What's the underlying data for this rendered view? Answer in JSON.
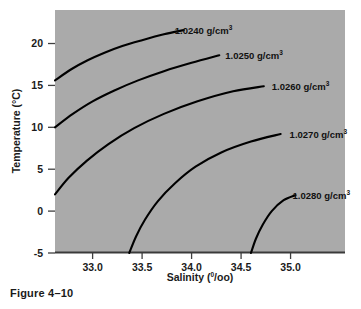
{
  "caption": "Figure 4–10",
  "colors": {
    "plot_background": "#aaaaaa",
    "page_background": "#ffffff",
    "contour_line": "#000000",
    "axis": "#3a3a3a",
    "text": "#1a1a1a"
  },
  "chart_data": {
    "type": "line",
    "title": "",
    "subtitle": "",
    "xlabel_text": "Salinity (",
    "xlabel_sup": "0",
    "xlabel_tail": "/oo)",
    "xlabel_full": "Salinity (0/oo)",
    "ylabel": "Temperature (°C)",
    "xlim": [
      32.62,
      35.55
    ],
    "ylim": [
      -5,
      24
    ],
    "xticks": [
      33.0,
      33.5,
      34.0,
      34.5,
      35.0
    ],
    "xtick_labels": [
      "33.0",
      "33.5",
      "34.0",
      "34.5",
      "35.0"
    ],
    "yticks": [
      20,
      15,
      10,
      5,
      0,
      -5
    ],
    "ytick_labels": [
      "20",
      "15",
      "10",
      "5",
      "0",
      "-5"
    ],
    "grid": false,
    "legend": "none",
    "annotation_note": "Each curve is an isopycnal (constant seawater density) labeled in g/cm3",
    "series": [
      {
        "name": "1.0240 g/cm3",
        "label_value": "1.0240",
        "label_unit": "g/cm",
        "label_sup": "3",
        "label_x": 33.79,
        "label_y": 21.6,
        "points": [
          [
            32.62,
            15.6
          ],
          [
            32.78,
            16.9
          ],
          [
            32.95,
            18.0
          ],
          [
            33.12,
            18.9
          ],
          [
            33.3,
            19.7
          ],
          [
            33.5,
            20.4
          ],
          [
            33.72,
            21.1
          ],
          [
            33.92,
            21.6
          ]
        ]
      },
      {
        "name": "1.0250 g/cm3",
        "label_value": "1.0250",
        "label_unit": "g/cm",
        "label_sup": "3",
        "label_x": 34.3,
        "label_y": 18.6,
        "points": [
          [
            32.62,
            10.0
          ],
          [
            32.8,
            11.6
          ],
          [
            33.0,
            13.1
          ],
          [
            33.22,
            14.4
          ],
          [
            33.46,
            15.6
          ],
          [
            33.72,
            16.7
          ],
          [
            34.0,
            17.7
          ],
          [
            34.28,
            18.6
          ]
        ]
      },
      {
        "name": "1.0260 g/cm3",
        "label_value": "1.0260",
        "label_unit": "g/cm",
        "label_sup": "3",
        "label_x": 34.77,
        "label_y": 14.9,
        "points": [
          [
            32.62,
            2.0
          ],
          [
            32.76,
            4.0
          ],
          [
            32.94,
            6.0
          ],
          [
            33.16,
            8.0
          ],
          [
            33.42,
            9.9
          ],
          [
            33.72,
            11.6
          ],
          [
            34.06,
            13.1
          ],
          [
            34.42,
            14.3
          ],
          [
            34.73,
            14.9
          ]
        ]
      },
      {
        "name": "1.0270 g/cm3",
        "label_value": "1.0270",
        "label_unit": "g/cm",
        "label_sup": "3",
        "label_x": 34.95,
        "label_y": 9.2,
        "points": [
          [
            33.37,
            -5.0
          ],
          [
            33.44,
            -3.0
          ],
          [
            33.53,
            -1.0
          ],
          [
            33.66,
            1.2
          ],
          [
            33.83,
            3.3
          ],
          [
            34.04,
            5.3
          ],
          [
            34.3,
            7.0
          ],
          [
            34.6,
            8.3
          ],
          [
            34.9,
            9.2
          ]
        ]
      },
      {
        "name": "1.0280 g/cm3",
        "label_value": "1.0280",
        "label_unit": "g/cm",
        "label_sup": "3",
        "label_x": 34.98,
        "label_y": 1.9,
        "points": [
          [
            34.6,
            -5.0
          ],
          [
            34.65,
            -3.3
          ],
          [
            34.72,
            -1.6
          ],
          [
            34.81,
            0.0
          ],
          [
            34.93,
            1.3
          ],
          [
            35.05,
            1.9
          ]
        ]
      }
    ]
  }
}
